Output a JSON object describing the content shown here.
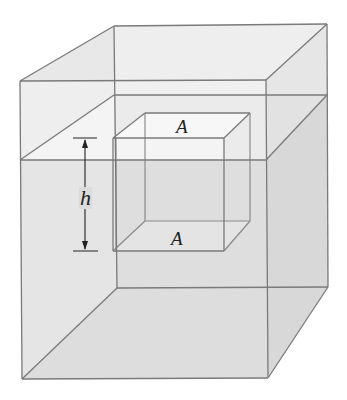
{
  "figure": {
    "labels": {
      "top_face": "A",
      "bottom_face": "A",
      "height": "h"
    },
    "colors": {
      "edge": "#7a7a7a",
      "glass_air": "#ececec",
      "glass_side_air": "#e6e6e6",
      "water_surface": "#f5f5f5",
      "water_front": "#dcdcdc",
      "water_right": "#d6d6d6",
      "water_floor": "#e0e0e0",
      "arrow": "#222222"
    },
    "geometry": {
      "outer_box": {
        "front_top_left": [
          20,
          81
        ],
        "front_top_right": [
          266,
          80
        ],
        "back_top_left": [
          114,
          26
        ],
        "back_top_right": [
          327,
          24
        ],
        "front_bottom_left": [
          22,
          379
        ],
        "front_bottom_right": [
          268,
          378
        ],
        "back_bottom_left": [
          117,
          288
        ],
        "back_bottom_right": [
          328,
          287
        ]
      },
      "water_line": {
        "front_y": 160,
        "back_y": 95
      },
      "inner_cube": {
        "front_top_left": [
          113,
          138
        ],
        "front_top_right": [
          224,
          138
        ],
        "back_top_left": [
          145,
          113
        ],
        "back_top_right": [
          250,
          113
        ],
        "front_bottom_left": [
          113,
          251
        ],
        "front_bottom_right": [
          224,
          251
        ],
        "back_bottom_left": [
          145,
          221
        ],
        "back_bottom_right": [
          250,
          221
        ]
      },
      "height_arrow": {
        "x": 85,
        "top_y": 138,
        "bottom_y": 251,
        "tick_x1": 73,
        "tick_x2": 97
      }
    }
  }
}
